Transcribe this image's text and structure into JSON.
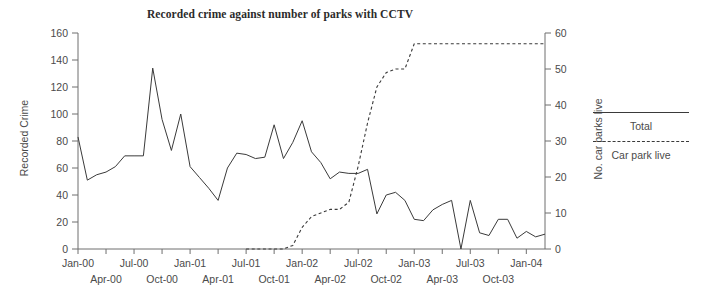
{
  "chart_data": {
    "type": "line",
    "title": "Recorded crime against number of parks with CCTV",
    "xlabel": "",
    "ylabel": "Recorded Crime",
    "y2label": "No. car parks live",
    "ylim": [
      0,
      160
    ],
    "y2lim": [
      0,
      60
    ],
    "yticks": [
      0,
      20,
      40,
      60,
      80,
      100,
      120,
      140,
      160
    ],
    "y2ticks": [
      0,
      10,
      20,
      30,
      40,
      50,
      60
    ],
    "grid": false,
    "legend_position": "right",
    "xtick_labels_top": [
      "Jan-00",
      "Jul-00",
      "Jan-01",
      "Jul-01",
      "Jan-02",
      "Jul-02",
      "Jan-03",
      "Jul-03",
      "Jan-04"
    ],
    "xtick_labels_bottom": [
      "Apr-00",
      "Oct-00",
      "Apr-01",
      "Oct-01",
      "Apr-02",
      "Oct-02",
      "Apr-03",
      "Oct-03"
    ],
    "x": [
      "Jan-00",
      "Feb-00",
      "Mar-00",
      "Apr-00",
      "May-00",
      "Jun-00",
      "Jul-00",
      "Aug-00",
      "Sep-00",
      "Oct-00",
      "Nov-00",
      "Dec-00",
      "Jan-01",
      "Feb-01",
      "Mar-01",
      "Apr-01",
      "May-01",
      "Jun-01",
      "Jul-01",
      "Aug-01",
      "Sep-01",
      "Oct-01",
      "Nov-01",
      "Dec-01",
      "Jan-02",
      "Feb-02",
      "Mar-02",
      "Apr-02",
      "May-02",
      "Jun-02",
      "Jul-02",
      "Aug-02",
      "Sep-02",
      "Oct-02",
      "Nov-02",
      "Dec-02",
      "Jan-03",
      "Feb-03",
      "Mar-03",
      "Apr-03",
      "May-03",
      "Jun-03",
      "Jul-03",
      "Aug-03",
      "Sep-03",
      "Oct-03",
      "Nov-03",
      "Dec-03",
      "Jan-04",
      "Feb-04",
      "Mar-04"
    ],
    "series": [
      {
        "name": "Total",
        "axis": "left",
        "style": "solid",
        "values": [
          83,
          51,
          55,
          57,
          61,
          69,
          69,
          69,
          134,
          96,
          73,
          100,
          61,
          53,
          45,
          36,
          60,
          71,
          70,
          67,
          68,
          92,
          67,
          79,
          95,
          72,
          64,
          52,
          57,
          56,
          56,
          59,
          26,
          40,
          42,
          36,
          22,
          21,
          29,
          33,
          36,
          0,
          36,
          12,
          10,
          22,
          22,
          8,
          13,
          9,
          11
        ]
      },
      {
        "name": "Car park live",
        "axis": "right",
        "style": "dashed",
        "values": [
          null,
          null,
          null,
          null,
          null,
          null,
          null,
          null,
          null,
          null,
          null,
          null,
          null,
          null,
          null,
          null,
          null,
          null,
          0,
          0,
          0,
          0,
          0,
          1,
          6,
          9,
          10,
          11,
          11,
          13,
          23,
          35,
          45,
          49,
          50,
          50,
          57,
          57,
          57,
          57,
          57,
          57,
          57,
          57,
          57,
          57,
          57,
          57,
          57,
          57,
          57
        ]
      }
    ],
    "series_tail_right": [
      13,
      16,
      19,
      19,
      16
    ],
    "legend": [
      {
        "label": "Total",
        "style": "solid"
      },
      {
        "label": "Car park live",
        "style": "dashed"
      }
    ]
  }
}
